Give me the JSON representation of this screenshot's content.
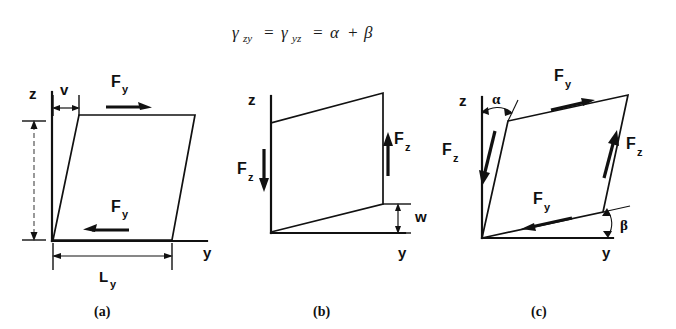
{
  "figure": {
    "equation": {
      "gamma1": "γ",
      "gamma1_sub": "zy",
      "eq1": "=",
      "gamma2": "γ",
      "gamma2_sub": "yz",
      "eq2": "=",
      "alpha": "α",
      "plus": "+",
      "beta": "β",
      "full_text": "γzy = γyz = α + β"
    },
    "ink_color": "#111111",
    "background_color": "#ffffff",
    "panels": [
      {
        "caption": "(a)",
        "axis_vertical": "z",
        "axis_horizontal": "y",
        "dimensions": [
          {
            "label": "v",
            "sub": "",
            "position": "top"
          },
          {
            "label": "L",
            "sub": "y",
            "position": "bottom"
          }
        ],
        "forces": [
          {
            "label": "F",
            "sub": "y",
            "direction": "right",
            "position": "top"
          },
          {
            "label": "F",
            "sub": "y",
            "direction": "left",
            "position": "bottom"
          }
        ]
      },
      {
        "caption": "(b)",
        "axis_vertical": "z",
        "axis_horizontal": "y",
        "dimensions": [
          {
            "label": "w",
            "sub": "",
            "position": "right"
          }
        ],
        "forces": [
          {
            "label": "F",
            "sub": "z",
            "direction": "down",
            "position": "left"
          },
          {
            "label": "F",
            "sub": "z",
            "direction": "up",
            "position": "right"
          }
        ]
      },
      {
        "caption": "(c)",
        "axis_vertical": "z",
        "axis_horizontal": "y",
        "angles": [
          {
            "label": "α",
            "position": "top-left"
          },
          {
            "label": "β",
            "position": "bottom-right"
          }
        ],
        "forces": [
          {
            "label": "F",
            "sub": "y",
            "direction": "right",
            "position": "top"
          },
          {
            "label": "F",
            "sub": "y",
            "direction": "left",
            "position": "bottom"
          },
          {
            "label": "F",
            "sub": "z",
            "direction": "down",
            "position": "left"
          },
          {
            "label": "F",
            "sub": "z",
            "direction": "up",
            "position": "right"
          }
        ]
      }
    ]
  }
}
